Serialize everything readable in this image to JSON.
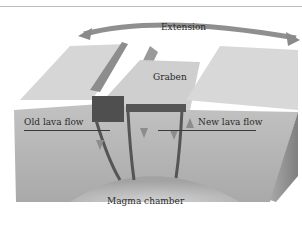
{
  "diagram": {
    "type": "block-diagram",
    "labels": {
      "extension": "Extension",
      "graben": "Graben",
      "old_lava_flow": "Old lava flow",
      "new_lava_flow": "New lava flow",
      "magma_chamber": "Magma chamber"
    },
    "colors": {
      "surface_light": "#d9d9d9",
      "surface_mid": "#c4c4c4",
      "front_face": "#b8b8b8",
      "side_face": "#9a9a9a",
      "dike_dark": "#4a4a4a",
      "arrow": "#8a8a8a",
      "text": "#2a2a2a"
    }
  }
}
